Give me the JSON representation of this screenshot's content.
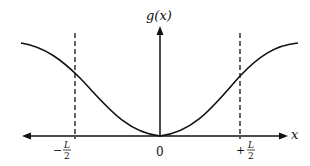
{
  "diagram": {
    "type": "function-plot",
    "y_axis_label": "g(x)",
    "x_axis_label": "x",
    "tick_labels": {
      "left": {
        "sign": "−",
        "numerator": "L",
        "denominator": "2"
      },
      "origin": "0",
      "right": {
        "sign": "+",
        "numerator": "L",
        "denominator": "2"
      }
    },
    "curve_description": "Bell-shaped inverted curve with minimum 0 at x=0, rising toward a plateau at both ends",
    "markers": [
      "dashed vertical line at -L/2",
      "dashed vertical line at +L/2"
    ],
    "colors": {
      "ink": "#111111",
      "background": "#ffffff"
    }
  }
}
